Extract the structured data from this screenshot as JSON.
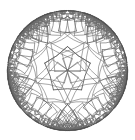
{
  "figure": {
    "title": "Hyperbolic tessellation in the Poincare disk",
    "kind": "poincare-disk-tiling",
    "background_color": "#ffffff"
  },
  "canvas": {
    "width": 135,
    "height": 140
  },
  "disk": {
    "center_x": 67.5,
    "center_y": 70.5,
    "radius": 60.0,
    "boundary_color": "#4a4a4a",
    "boundary_stroke_width": 0.9
  },
  "style": {
    "line_color": "#555555",
    "line_color_outer": "#6b6b6b",
    "line_width_inner": 0.85,
    "line_width_outer": 0.6,
    "fill_color": "none"
  },
  "chart_data": {
    "type": "diagram",
    "title": "Hyperbolic tessellation in the Poincare disk",
    "model": "poincare-disk",
    "schlafli_p": 5,
    "schlafli_q": 4,
    "generations": 5,
    "central_cell_vertices": 5,
    "central_cell_rotation_deg": 18,
    "central_cell_radius_frac": 0.27,
    "xlabel": "",
    "ylabel": "",
    "grid": false,
    "legend": "none"
  }
}
